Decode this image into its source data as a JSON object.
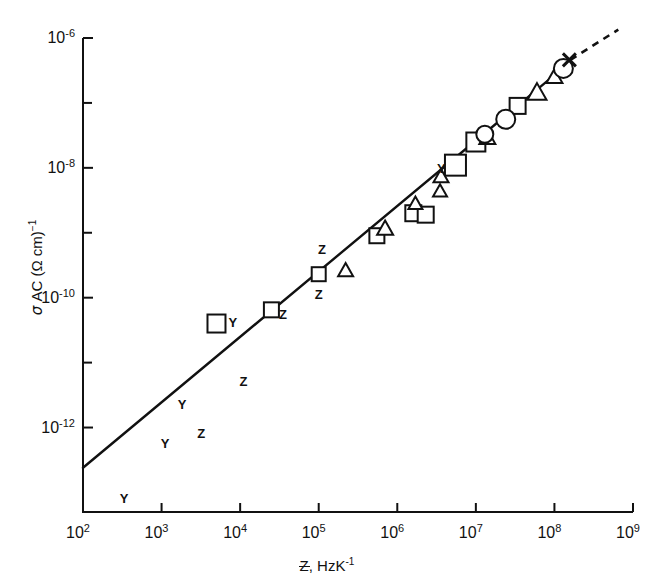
{
  "chart_data": {
    "type": "scatter",
    "title": "",
    "xlabel": "Z, HzK-1",
    "ylabel": "sigma AC (Ohm cm)-1",
    "xscale": "log",
    "yscale": "log",
    "xlim": [
      100,
      1000000000
    ],
    "ylim": [
      5e-14,
      1e-06
    ],
    "grid": false,
    "legend": "none",
    "xticks": [
      {
        "value": 100,
        "label_base": "10",
        "label_exp": "2"
      },
      {
        "value": 1000,
        "label_base": "10",
        "label_exp": "3"
      },
      {
        "value": 10000,
        "label_base": "10",
        "label_exp": "4"
      },
      {
        "value": 100000,
        "label_base": "10",
        "label_exp": "5"
      },
      {
        "value": 1000000,
        "label_base": "10",
        "label_exp": "6"
      },
      {
        "value": 10000000,
        "label_base": "10",
        "label_exp": "7"
      },
      {
        "value": 100000000,
        "label_base": "10",
        "label_exp": "8"
      },
      {
        "value": 1000000000,
        "label_base": "10",
        "label_exp": "9"
      }
    ],
    "yticks": [
      {
        "value": 1e-06,
        "label_base": "10",
        "label_exp": "-6",
        "major": true
      },
      {
        "value": 1e-07,
        "label_base": "",
        "label_exp": "",
        "major": false
      },
      {
        "value": 1e-08,
        "label_base": "10",
        "label_exp": "-8",
        "major": true
      },
      {
        "value": 1e-09,
        "label_base": "",
        "label_exp": "",
        "major": false
      },
      {
        "value": 1e-10,
        "label_base": "10",
        "label_exp": "-10",
        "major": true
      },
      {
        "value": 1e-11,
        "label_base": "",
        "label_exp": "",
        "major": false
      },
      {
        "value": 1e-12,
        "label_base": "10",
        "label_exp": "-12",
        "major": true
      }
    ],
    "fit_line": {
      "name": "power-law fit",
      "style": "solid",
      "x_start": 100,
      "y_start": 2.4e-13,
      "x_end": 130000000.0,
      "y_end": 3.5e-07,
      "slope_decades": 1.05
    },
    "fit_line_extension": {
      "name": "dashed extrapolation",
      "style": "dashed",
      "x_start": 160000000.0,
      "y_start": 4.6e-07,
      "x_end": 650000000.0,
      "y_end": 1.35e-06
    },
    "series": [
      {
        "name": "squares",
        "marker": "open-square",
        "points": [
          {
            "x": 5000.0,
            "y": 4e-11
          },
          {
            "x": 25000.0,
            "y": 6.5e-11
          },
          {
            "x": 100000.0,
            "y": 2.3e-10
          },
          {
            "x": 550000.0,
            "y": 9e-10
          },
          {
            "x": 1600000.0,
            "y": 2e-09
          },
          {
            "x": 2300000.0,
            "y": 1.9e-09
          },
          {
            "x": 5500000.0,
            "y": 1.1e-08
          },
          {
            "x": 10000000.0,
            "y": 2.5e-08
          },
          {
            "x": 34000000.0,
            "y": 9e-08
          }
        ]
      },
      {
        "name": "triangles",
        "marker": "open-triangle",
        "points": [
          {
            "x": 220000.0,
            "y": 2.7e-10
          },
          {
            "x": 700000.0,
            "y": 1.2e-09
          },
          {
            "x": 1700000.0,
            "y": 2.9e-09
          },
          {
            "x": 3500000.0,
            "y": 4.5e-09
          },
          {
            "x": 3600000.0,
            "y": 7.6e-09
          },
          {
            "x": 14000000.0,
            "y": 3e-08
          },
          {
            "x": 60000000.0,
            "y": 1.5e-07
          },
          {
            "x": 100000000.0,
            "y": 2.6e-07
          }
        ]
      },
      {
        "name": "circles",
        "marker": "open-circle",
        "points": [
          {
            "x": 13000000.0,
            "y": 3.3e-08
          },
          {
            "x": 24000000.0,
            "y": 5.6e-08
          },
          {
            "x": 130000000.0,
            "y": 3.4e-07
          }
        ]
      },
      {
        "name": "cross endpoint",
        "marker": "x-cross",
        "points": [
          {
            "x": 155000000.0,
            "y": 4.6e-07
          }
        ]
      },
      {
        "name": "Y letters",
        "marker": "letter-Y",
        "points": [
          {
            "x": 330.0,
            "y": 8e-14
          },
          {
            "x": 1100.0,
            "y": 5.5e-13
          },
          {
            "x": 1800.0,
            "y": 2.2e-12
          },
          {
            "x": 8000.0,
            "y": 4.1e-11
          },
          {
            "x": 3600000.0,
            "y": 9.5e-09
          }
        ]
      },
      {
        "name": "Z letters",
        "marker": "letter-Z",
        "points": [
          {
            "x": 3200.0,
            "y": 8e-13
          },
          {
            "x": 11000.0,
            "y": 5e-12
          },
          {
            "x": 35000.0,
            "y": 5.5e-11
          },
          {
            "x": 100000.0,
            "y": 1.1e-10
          },
          {
            "x": 110000.0,
            "y": 5.5e-10
          }
        ]
      }
    ]
  },
  "axes": {
    "xlabel_prefix": "Z",
    "xlabel_suffix": ", HzK",
    "xlabel_exp": "-1",
    "ylabel_sigma": "σ",
    "ylabel_sub": " AC ",
    "ylabel_unit": "(Ω cm)",
    "ylabel_exp": "−1"
  }
}
